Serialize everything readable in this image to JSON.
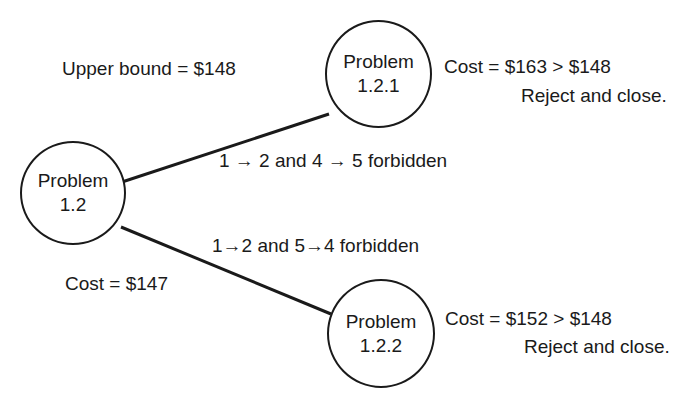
{
  "upper_bound_label": "Upper bound = $148",
  "nodes": [
    {
      "id": "1.2",
      "line1": "Problem",
      "line2": "1.2",
      "cost_label": "Cost = $147"
    },
    {
      "id": "1.2.1",
      "line1": "Problem",
      "line2": "1.2.1",
      "cost_label": "Cost = $163 > $148",
      "status": "Reject and close."
    },
    {
      "id": "1.2.2",
      "line1": "Problem",
      "line2": "1.2.2",
      "cost_label": "Cost = $152 > $148",
      "status": "Reject and close."
    }
  ],
  "edges": [
    {
      "from": "1.2",
      "to": "1.2.1",
      "label": "1 → 2 and 4 → 5 forbidden"
    },
    {
      "from": "1.2",
      "to": "1.2.2",
      "label": "1→2 and 5→4 forbidden"
    }
  ],
  "colors": {
    "line": "#1a1a1a",
    "background": "#ffffff"
  }
}
